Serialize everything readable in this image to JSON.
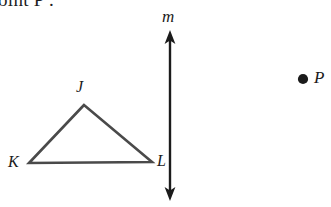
{
  "figure": {
    "type": "geometry-diagram",
    "canvas": {
      "width": 331,
      "height": 207,
      "background": "#ffffff"
    },
    "prompt": {
      "text": "oint P .",
      "note": "clipped text at top edge of image"
    },
    "stroke_color": "#4a4a4a",
    "line_color": "#1b1b1b",
    "label_color": "#1b1b1b",
    "triangle": {
      "name": "triangle-JKL",
      "vertices": [
        {
          "label": "J",
          "x": 84,
          "y": 105
        },
        {
          "label": "K",
          "x": 29,
          "y": 163
        },
        {
          "label": "L",
          "x": 152,
          "y": 162
        }
      ],
      "labels": {
        "J": "J",
        "K": "K",
        "L": "L"
      }
    },
    "line": {
      "name": "line-m",
      "label": "m",
      "x": 170,
      "y_top": 33,
      "y_bottom": 198,
      "arrows": "both"
    },
    "point": {
      "name": "point-P",
      "label": "P",
      "x": 303,
      "y": 79,
      "marker": "filled-dot"
    }
  }
}
